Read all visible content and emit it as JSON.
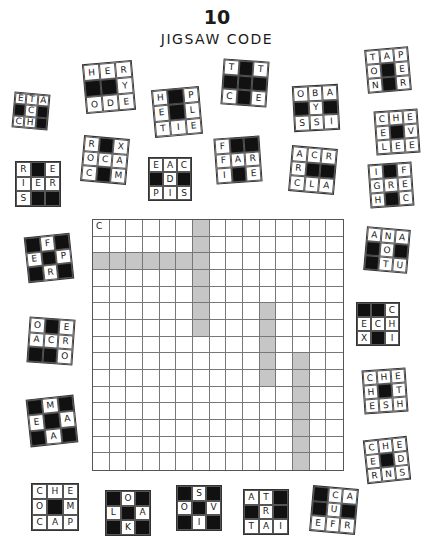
{
  "header": {
    "number": "10",
    "title": "JIGSAW CODE"
  },
  "grid": {
    "size": 15,
    "start_letter": "C",
    "shaded": [
      [
        0,
        6
      ],
      [
        1,
        6
      ],
      [
        2,
        0
      ],
      [
        2,
        1
      ],
      [
        2,
        2
      ],
      [
        2,
        3
      ],
      [
        2,
        4
      ],
      [
        2,
        5
      ],
      [
        2,
        6
      ],
      [
        3,
        6
      ],
      [
        4,
        6
      ],
      [
        5,
        6
      ],
      [
        6,
        6
      ],
      [
        5,
        10
      ],
      [
        6,
        10
      ],
      [
        7,
        10
      ],
      [
        8,
        10
      ],
      [
        9,
        10
      ],
      [
        8,
        12
      ],
      [
        9,
        12
      ],
      [
        10,
        12
      ],
      [
        11,
        12
      ],
      [
        12,
        12
      ],
      [
        13,
        12
      ],
      [
        14,
        12
      ]
    ]
  },
  "pieces": [
    {
      "x": 13,
      "y": 93,
      "s": 36,
      "r": 5,
      "cells": [
        "E",
        "T",
        "A",
        "#",
        "C",
        "#",
        "C",
        "H",
        "#"
      ]
    },
    {
      "x": 84,
      "y": 62,
      "s": 50,
      "r": -5,
      "cells": [
        "H",
        "E",
        "R",
        "#",
        "#",
        "Y",
        "O",
        "D",
        "E"
      ]
    },
    {
      "x": 153,
      "y": 88,
      "s": 48,
      "r": -5,
      "cells": [
        "H",
        "#",
        "P",
        "E",
        "#",
        "L",
        "T",
        "I",
        "E"
      ]
    },
    {
      "x": 222,
      "y": 60,
      "s": 46,
      "r": 4,
      "cells": [
        "T",
        "#",
        "T",
        "#",
        "#",
        "#",
        "C",
        "#",
        "E"
      ]
    },
    {
      "x": 293,
      "y": 85,
      "s": 46,
      "r": -3,
      "cells": [
        "O",
        "B",
        "A",
        "#",
        "Y",
        "#",
        "S",
        "S",
        "I"
      ]
    },
    {
      "x": 366,
      "y": 48,
      "s": 44,
      "r": -5,
      "cells": [
        "T",
        "A",
        "P",
        "O",
        "#",
        "E",
        "N",
        "#",
        "R"
      ]
    },
    {
      "x": 375,
      "y": 110,
      "s": 44,
      "r": -4,
      "cells": [
        "C",
        "H",
        "E",
        "E",
        "#",
        "V",
        "L",
        "E",
        "E"
      ]
    },
    {
      "x": 82,
      "y": 137,
      "s": 46,
      "r": 5,
      "cells": [
        "R",
        "#",
        "X",
        "O",
        "C",
        "A",
        "C",
        "#",
        "M"
      ]
    },
    {
      "x": 148,
      "y": 157,
      "s": 44,
      "r": 0,
      "cells": [
        "E",
        "A",
        "C",
        "#",
        "D",
        "#",
        "P",
        "I",
        "S"
      ]
    },
    {
      "x": 15,
      "y": 161,
      "s": 46,
      "r": 0,
      "cells": [
        "R",
        "#",
        "E",
        "I",
        "E",
        "R",
        "S",
        "#",
        "#"
      ]
    },
    {
      "x": 215,
      "y": 137,
      "s": 46,
      "r": -4,
      "cells": [
        "F",
        "#",
        "#",
        "F",
        "A",
        "R",
        "I",
        "#",
        "E"
      ]
    },
    {
      "x": 290,
      "y": 147,
      "s": 46,
      "r": 5,
      "cells": [
        "A",
        "C",
        "R",
        "R",
        "#",
        "#",
        "C",
        "L",
        "A"
      ]
    },
    {
      "x": 369,
      "y": 163,
      "s": 44,
      "r": -4,
      "cells": [
        "I",
        "#",
        "F",
        "G",
        "R",
        "E",
        "H",
        "#",
        "C"
      ]
    },
    {
      "x": 26,
      "y": 235,
      "s": 46,
      "r": -6,
      "cells": [
        "#",
        "F",
        "#",
        "E",
        "#",
        "P",
        "#",
        "R",
        "#"
      ]
    },
    {
      "x": 365,
      "y": 228,
      "s": 44,
      "r": 5,
      "cells": [
        "A",
        "N",
        "A",
        "#",
        "O",
        "#",
        "#",
        "T",
        "U"
      ]
    },
    {
      "x": 28,
      "y": 318,
      "s": 46,
      "r": 4,
      "cells": [
        "O",
        "#",
        "E",
        "A",
        "C",
        "R",
        "#",
        "#",
        "O"
      ]
    },
    {
      "x": 356,
      "y": 302,
      "s": 44,
      "r": 0,
      "cells": [
        "#",
        "#",
        "C",
        "E",
        "C",
        "H",
        "X",
        "#",
        "I"
      ]
    },
    {
      "x": 28,
      "y": 397,
      "s": 48,
      "r": -6,
      "cells": [
        "#",
        "M",
        "#",
        "E",
        "#",
        "A",
        "#",
        "A",
        "#"
      ]
    },
    {
      "x": 363,
      "y": 369,
      "s": 44,
      "r": -4,
      "cells": [
        "C",
        "H",
        "E",
        "H",
        "#",
        "T",
        "E",
        "S",
        "H"
      ]
    },
    {
      "x": 365,
      "y": 438,
      "s": 44,
      "r": -6,
      "cells": [
        "C",
        "H",
        "E",
        "E",
        "#",
        "D",
        "R",
        "N",
        "S"
      ]
    },
    {
      "x": 31,
      "y": 483,
      "s": 48,
      "r": 0,
      "cells": [
        "C",
        "H",
        "E",
        "O",
        "#",
        "M",
        "C",
        "A",
        "P"
      ]
    },
    {
      "x": 105,
      "y": 490,
      "s": 46,
      "r": 0,
      "cells": [
        "#",
        "O",
        "#",
        "L",
        "#",
        "A",
        "#",
        "K",
        "#"
      ]
    },
    {
      "x": 176,
      "y": 485,
      "s": 46,
      "r": 0,
      "cells": [
        "#",
        "S",
        "#",
        "O",
        "#",
        "V",
        "#",
        "I",
        "#"
      ]
    },
    {
      "x": 243,
      "y": 489,
      "s": 46,
      "r": 0,
      "cells": [
        "A",
        "T",
        "#",
        "#",
        "R",
        "#",
        "T",
        "A",
        "I"
      ]
    },
    {
      "x": 311,
      "y": 487,
      "s": 46,
      "r": 5,
      "cells": [
        "#",
        "C",
        "A",
        "#",
        "U",
        "#",
        "E",
        "F",
        "R"
      ]
    }
  ]
}
